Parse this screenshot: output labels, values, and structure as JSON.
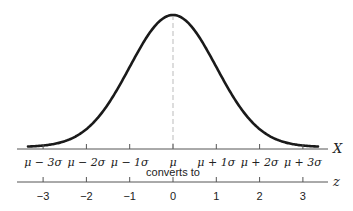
{
  "figure": {
    "title": "",
    "x_axis": {
      "name": "X",
      "tick_labels": [
        "μ − 3σ",
        "μ − 2σ",
        "μ − 1σ",
        "μ",
        "μ + 1σ",
        "μ + 2σ",
        "μ + 3σ"
      ]
    },
    "connector_text": "converts to",
    "z_axis": {
      "name": "z",
      "tick_labels": [
        "−3",
        "−2",
        "−1",
        "0",
        "1",
        "2",
        "3"
      ]
    },
    "colors": {
      "curve": "#1a1a1a",
      "axis": "#555555",
      "mean_line": "#bbbbbb",
      "text": "#222222"
    }
  },
  "chart_data": {
    "type": "line",
    "xlabel": "X",
    "secondary_xlabel": "z",
    "ylabel": "",
    "x": [
      -3.3,
      -3,
      -2.5,
      -2,
      -1.5,
      -1,
      -0.5,
      0,
      0.5,
      1,
      1.5,
      2,
      2.5,
      3,
      3.3
    ],
    "series": [
      {
        "name": "normal density",
        "values": [
          0.0017,
          0.0044,
          0.0175,
          0.054,
          0.1295,
          0.242,
          0.3521,
          0.3989,
          0.3521,
          0.242,
          0.1295,
          0.054,
          0.0175,
          0.0044,
          0.0017
        ]
      }
    ],
    "x_tick_labels": [
      "μ−3σ",
      "μ−2σ",
      "μ−1σ",
      "μ",
      "μ+1σ",
      "μ+2σ",
      "μ+3σ"
    ],
    "z_tick_labels": [
      "−3",
      "−2",
      "−1",
      "0",
      "1",
      "2",
      "3"
    ],
    "annotations": [
      "converts to",
      "dashed vertical line at mean μ"
    ],
    "grid": false
  }
}
